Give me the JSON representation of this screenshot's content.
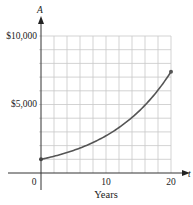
{
  "chart_data": {
    "type": "line",
    "title": "",
    "xlabel": "Years",
    "ylabel": "A",
    "x_axis_var": "t",
    "xlim": [
      0,
      20
    ],
    "ylim": [
      0,
      10000
    ],
    "x_ticks": [
      0,
      10,
      20
    ],
    "x_tick_labels": [
      "0",
      "10",
      "20"
    ],
    "y_ticks": [
      5000,
      10000
    ],
    "y_tick_labels": [
      "$5,000",
      "$10,000"
    ],
    "grid": true,
    "grid_x_step": 2,
    "grid_y_step": 1000,
    "series": [
      {
        "name": "A",
        "x": [
          0,
          2,
          4,
          6,
          8,
          10,
          12,
          14,
          16,
          18,
          20
        ],
        "values": [
          1000,
          1221,
          1492,
          1822,
          2226,
          2718,
          3320,
          4055,
          4953,
          6050,
          7389
        ]
      }
    ],
    "endpoints": [
      {
        "x": 0,
        "y": 1000
      },
      {
        "x": 20,
        "y": 7389
      }
    ]
  },
  "labels": {
    "y_axis": "A",
    "x_axis": "t",
    "x_title": "Years",
    "y10000": "$10,000",
    "y5000": "$5,000",
    "x0": "0",
    "x10": "10",
    "x20": "20"
  }
}
